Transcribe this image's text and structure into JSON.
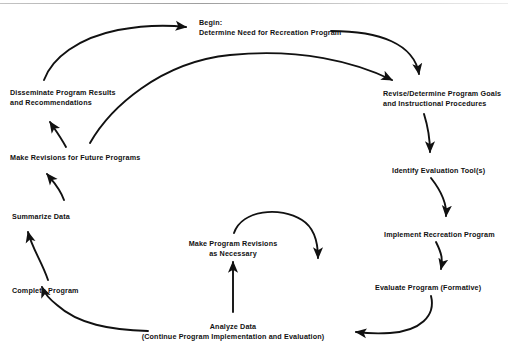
{
  "diagram": {
    "background_color": "#ffffff",
    "line_color": "#111111",
    "nodes": [
      {
        "id": "begin",
        "name": "begin-determine-need",
        "lines": [
          "Begin:",
          "Determine Need for Recreation Program"
        ],
        "x": 199,
        "y": 18,
        "align": "left"
      },
      {
        "id": "revise-goals",
        "name": "revise-determine-program-goals",
        "lines": [
          "Revise/Determine Program Goals",
          "and Instructional Procedures"
        ],
        "x": 383,
        "y": 89,
        "align": "left"
      },
      {
        "id": "identify-tools",
        "name": "identify-evaluation-tools",
        "lines": [
          "Identify Evaluation Tool(s)"
        ],
        "x": 392,
        "y": 166,
        "align": "left"
      },
      {
        "id": "implement",
        "name": "implement-recreation-program",
        "lines": [
          "Implement Recreation Program"
        ],
        "x": 384,
        "y": 230,
        "align": "left"
      },
      {
        "id": "evaluate",
        "name": "evaluate-program-formative",
        "lines": [
          "Evaluate Program (Formative)"
        ],
        "x": 375,
        "y": 283,
        "align": "left"
      },
      {
        "id": "analyze",
        "name": "analyze-data",
        "lines": [
          "Analyze Data",
          "(Continue Program Implementation and Evaluation)"
        ],
        "x": 233,
        "y": 322,
        "align": "center"
      },
      {
        "id": "make-revisions-necessary",
        "name": "make-program-revisions-as-necessary",
        "lines": [
          "Make Program Revisions",
          "as Necessary"
        ],
        "x": 233,
        "y": 239,
        "align": "center"
      },
      {
        "id": "complete-program",
        "name": "complete-program",
        "lines": [
          "Complete Program"
        ],
        "x": 12,
        "y": 286,
        "align": "left"
      },
      {
        "id": "summarize-data",
        "name": "summarize-data",
        "lines": [
          "Summarize Data"
        ],
        "x": 12,
        "y": 212,
        "align": "left"
      },
      {
        "id": "make-revisions-future",
        "name": "make-revisions-for-future-programs",
        "lines": [
          "Make Revisions for Future Programs"
        ],
        "x": 10,
        "y": 153,
        "align": "left"
      },
      {
        "id": "disseminate",
        "name": "disseminate-program-results",
        "lines": [
          "Disseminate Program Results",
          "and Recommendations"
        ],
        "x": 10,
        "y": 88,
        "align": "left"
      }
    ],
    "edges": [
      {
        "name": "edge-disseminate-to-begin",
        "from": "disseminate",
        "to": "begin"
      },
      {
        "name": "edge-makerevisions-to-revisegoals",
        "from": "make-revisions-for-future-programs",
        "to": "revise-goals"
      },
      {
        "name": "edge-begin-to-revisegoals",
        "from": "begin",
        "to": "revise-goals"
      },
      {
        "name": "edge-revisegoals-to-identifytools",
        "from": "revise-goals",
        "to": "identify-tools"
      },
      {
        "name": "edge-identifytools-to-implement",
        "from": "identify-tools",
        "to": "implement"
      },
      {
        "name": "edge-implement-to-evaluate",
        "from": "implement",
        "to": "evaluate"
      },
      {
        "name": "edge-evaluate-to-analyze",
        "from": "evaluate",
        "to": "analyze"
      },
      {
        "name": "edge-analyze-to-makerevisions",
        "from": "analyze",
        "to": "make-revisions-necessary"
      },
      {
        "name": "edge-makerevisions-to-implementloop",
        "from": "make-revisions-necessary",
        "to": "evaluate"
      },
      {
        "name": "edge-analyze-to-completeprogram",
        "from": "analyze",
        "to": "complete-program"
      },
      {
        "name": "edge-completeprogram-to-summarize",
        "from": "complete-program",
        "to": "summarize-data"
      },
      {
        "name": "edge-summarize-to-makerevisionsfuture",
        "from": "summarize-data",
        "to": "make-revisions-for-future-programs"
      },
      {
        "name": "edge-makerevisionsfuture-to-disseminate",
        "from": "make-revisions-for-future-programs",
        "to": "disseminate"
      }
    ]
  }
}
